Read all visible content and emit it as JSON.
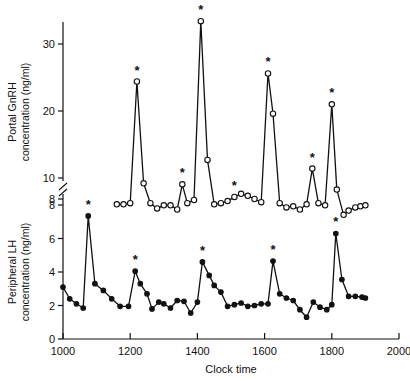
{
  "chart_data": {
    "type": "line",
    "title": "",
    "xlabel": "Clock time",
    "xlim": [
      1000,
      2000
    ],
    "xticks": [
      1000,
      1200,
      1400,
      1600,
      1800,
      2000
    ],
    "xticklabels": [
      "1000",
      "1200",
      "1400",
      "1600",
      "1800",
      "2000"
    ],
    "grid": false,
    "legend": "none",
    "axis_break": {
      "present": true,
      "between": [
        8,
        10
      ],
      "symbol": "//"
    },
    "panels": [
      {
        "name": "portal-gnrh",
        "ylabel": "Portal GnRH concentration (ng/ml)",
        "yticks": [
          8,
          10,
          20,
          30
        ],
        "yticklabels": [
          "8",
          "10",
          "20",
          "30"
        ],
        "ylim": [
          6.2,
          35
        ],
        "marker": "open-circle",
        "series_name": "Portal GnRH"
      },
      {
        "name": "peripheral-lh",
        "ylabel": "Peripheral LH concentration (ng/ml)",
        "yticks": [
          0,
          2,
          4,
          6,
          8
        ],
        "yticklabels": [
          "0",
          "2",
          "4",
          "6",
          "8"
        ],
        "ylim": [
          0,
          8.6
        ],
        "marker": "filled-circle",
        "series_name": "Peripheral LH"
      }
    ],
    "series": [
      {
        "name": "Portal GnRH",
        "panel": "portal-gnrh",
        "units": "ng/ml",
        "marker": "open-circle",
        "x": [
          1160,
          1180,
          1200,
          1220,
          1240,
          1260,
          1280,
          1300,
          1320,
          1340,
          1355,
          1370,
          1390,
          1410,
          1430,
          1450,
          1470,
          1490,
          1510,
          1530,
          1550,
          1570,
          1590,
          1610,
          1625,
          1645,
          1665,
          1685,
          1705,
          1725,
          1742,
          1760,
          1780,
          1800,
          1815,
          1835,
          1850,
          1870,
          1885,
          1900
        ],
        "y": [
          7.5,
          7.5,
          7.6,
          24.4,
          9.5,
          7.6,
          7.1,
          7.4,
          7.4,
          7.0,
          9.4,
          7.6,
          7.9,
          33.4,
          12.7,
          7.5,
          7.6,
          7.8,
          8.2,
          8.5,
          8.3,
          8.0,
          7.7,
          25.6,
          19.6,
          7.6,
          7.2,
          7.3,
          7.0,
          7.5,
          11.4,
          7.6,
          7.4,
          21.0,
          8.9,
          6.5,
          6.9,
          7.2,
          7.3,
          7.4
        ],
        "pulse_markers_x": [
          1220,
          1355,
          1410,
          1510,
          1610,
          1742,
          1800
        ],
        "pulse_marker_symbol": "*"
      },
      {
        "name": "Peripheral LH",
        "panel": "peripheral-lh",
        "units": "ng/ml",
        "marker": "filled-circle",
        "x": [
          1000,
          1020,
          1040,
          1060,
          1075,
          1095,
          1120,
          1145,
          1170,
          1195,
          1215,
          1230,
          1250,
          1265,
          1285,
          1300,
          1320,
          1340,
          1360,
          1380,
          1400,
          1415,
          1435,
          1450,
          1470,
          1490,
          1510,
          1530,
          1550,
          1570,
          1590,
          1610,
          1625,
          1645,
          1665,
          1685,
          1705,
          1725,
          1745,
          1765,
          1785,
          1800,
          1812,
          1830,
          1850,
          1870,
          1890,
          1900
        ],
        "y": [
          3.1,
          2.4,
          2.1,
          1.85,
          7.35,
          3.3,
          2.9,
          2.4,
          1.95,
          1.95,
          4.05,
          3.3,
          2.7,
          1.8,
          2.2,
          2.1,
          1.85,
          2.3,
          2.25,
          1.55,
          2.2,
          4.6,
          3.8,
          3.2,
          2.8,
          1.95,
          2.05,
          2.15,
          1.95,
          2.0,
          2.1,
          2.1,
          4.65,
          2.7,
          2.45,
          2.3,
          1.75,
          1.3,
          2.2,
          1.9,
          1.75,
          2.05,
          6.3,
          3.55,
          2.55,
          2.55,
          2.5,
          2.45
        ],
        "pulse_markers_x": [
          1075,
          1215,
          1415,
          1625,
          1812
        ],
        "pulse_marker_symbol": "*"
      }
    ]
  },
  "figure": {
    "xaxis_title": "Clock time",
    "gnrh_label_line1": "Portal GnRH",
    "gnrh_label_line2": "concentration (ng/ml)",
    "lh_label_line1": "Peripheral LH",
    "lh_label_line2": "concentration (ng/ml)"
  }
}
